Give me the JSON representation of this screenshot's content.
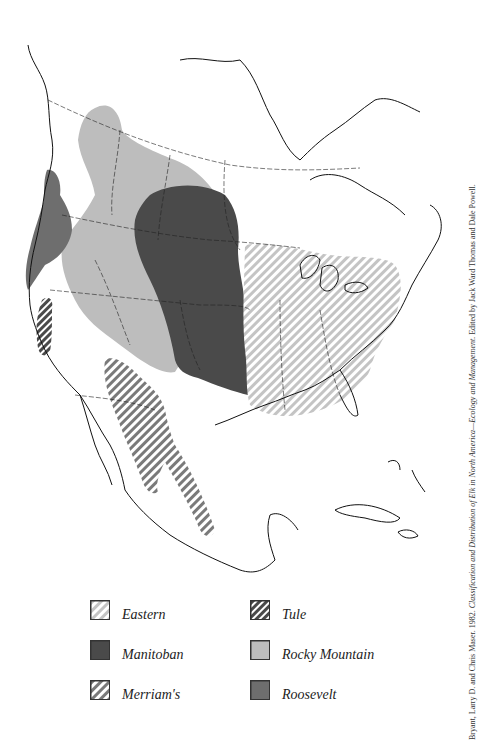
{
  "map": {
    "title": "Distribution of Elk Subspecies in North America",
    "colors": {
      "manitoban": "#4a4a4a",
      "rocky_mountain": "#bdbdbd",
      "roosevelt": "#6e6e6e",
      "eastern_stripe": "#bdbdbd",
      "merriams_stripe": "#7a7a7a",
      "tule_stripe": "#4a4a4a",
      "outline": "#111111"
    }
  },
  "legend": {
    "items": [
      {
        "key": "eastern",
        "label": "Eastern",
        "pattern": "light-hatch"
      },
      {
        "key": "manitoban",
        "label": "Manitoban",
        "pattern": "solid-dark"
      },
      {
        "key": "merriams",
        "label": "Merriam's",
        "pattern": "medium-hatch"
      },
      {
        "key": "tule",
        "label": "Tule",
        "pattern": "dark-hatch"
      },
      {
        "key": "rocky_mountain",
        "label": "Rocky Mountain",
        "pattern": "solid-light"
      },
      {
        "key": "roosevelt",
        "label": "Roosevelt",
        "pattern": "solid-medium"
      }
    ]
  },
  "citation": {
    "prefix": "Bryant, Larry D. and Chris Maser. 1982. ",
    "title": "Classification and Distribution of Elk in North America—Ecology and Management.",
    "suffix": " Edited by Jack Ward Thomas and Dale Powell."
  }
}
